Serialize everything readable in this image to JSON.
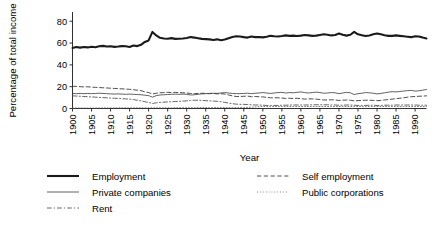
{
  "chart_data": {
    "type": "line",
    "title": "",
    "xlabel": "Year",
    "ylabel": "Percentage of total income",
    "xlim": [
      1900,
      1993
    ],
    "ylim": [
      0,
      88
    ],
    "yticks": [
      0,
      20,
      40,
      60,
      80
    ],
    "ytick_labels": [
      "0",
      "20",
      "40",
      "60",
      "80"
    ],
    "xticks": [
      1900,
      1905,
      1910,
      1915,
      1920,
      1925,
      1930,
      1935,
      1940,
      1945,
      1950,
      1955,
      1960,
      1965,
      1970,
      1975,
      1980,
      1985,
      1990
    ],
    "xtick_labels": [
      "1900",
      "1905",
      "1910",
      "1915",
      "1920",
      "1925",
      "1930",
      "1935",
      "1940",
      "1945",
      "1950",
      "1955",
      "1960",
      "1965",
      "1970",
      "1975",
      "1980",
      "1985",
      "1990"
    ],
    "grid": false,
    "legend_position": "bottom",
    "x": [
      1900,
      1901,
      1902,
      1903,
      1904,
      1905,
      1906,
      1907,
      1908,
      1909,
      1910,
      1911,
      1912,
      1913,
      1914,
      1915,
      1916,
      1917,
      1918,
      1919,
      1920,
      1921,
      1922,
      1923,
      1924,
      1925,
      1926,
      1927,
      1928,
      1929,
      1930,
      1931,
      1932,
      1933,
      1934,
      1935,
      1936,
      1937,
      1938,
      1939,
      1940,
      1941,
      1942,
      1943,
      1944,
      1945,
      1946,
      1947,
      1948,
      1949,
      1950,
      1951,
      1952,
      1953,
      1954,
      1955,
      1956,
      1957,
      1958,
      1959,
      1960,
      1961,
      1962,
      1963,
      1964,
      1965,
      1966,
      1967,
      1968,
      1969,
      1970,
      1971,
      1972,
      1973,
      1974,
      1975,
      1976,
      1977,
      1978,
      1979,
      1980,
      1981,
      1982,
      1983,
      1984,
      1985,
      1986,
      1987,
      1988,
      1989,
      1990,
      1991,
      1992,
      1993
    ],
    "series": [
      {
        "name": "Employment",
        "style": "solid",
        "width": 2.1,
        "color": "#1a1a1a",
        "values": [
          55.5,
          56.3,
          55.8,
          56.4,
          56.0,
          56.6,
          56.2,
          57.0,
          57.4,
          56.8,
          57.0,
          56.5,
          56.8,
          57.2,
          57.0,
          56.4,
          57.8,
          57.2,
          58.4,
          61.0,
          62.4,
          70.2,
          67.0,
          64.8,
          64.2,
          64.0,
          64.5,
          63.8,
          64.0,
          64.2,
          64.6,
          65.5,
          65.0,
          64.4,
          63.8,
          63.6,
          63.4,
          62.8,
          63.4,
          62.6,
          63.2,
          64.4,
          65.6,
          66.2,
          66.0,
          65.4,
          65.0,
          66.0,
          65.4,
          65.6,
          65.2,
          65.8,
          66.6,
          66.2,
          66.0,
          66.4,
          67.0,
          66.6,
          66.8,
          66.4,
          66.8,
          67.4,
          67.0,
          66.6,
          66.8,
          67.4,
          68.0,
          67.6,
          67.0,
          67.4,
          68.8,
          67.6,
          66.8,
          67.6,
          70.2,
          68.0,
          67.2,
          66.4,
          67.0,
          68.0,
          68.8,
          68.0,
          67.2,
          66.6,
          66.6,
          67.0,
          66.6,
          66.2,
          65.8,
          65.4,
          66.2,
          66.0,
          65.0,
          64.2
        ]
      },
      {
        "name": "Self employment",
        "style": "dashed",
        "width": 0.9,
        "color": "#3a3a3a",
        "values": [
          20.4,
          20.2,
          20.0,
          19.8,
          19.9,
          19.6,
          19.4,
          19.2,
          19.0,
          18.8,
          18.6,
          18.4,
          18.2,
          18.0,
          17.8,
          17.6,
          17.2,
          16.8,
          16.4,
          15.2,
          14.6,
          13.2,
          14.0,
          14.4,
          14.6,
          14.8,
          14.6,
          14.8,
          14.6,
          14.4,
          14.2,
          13.8,
          13.6,
          13.8,
          14.0,
          13.8,
          13.6,
          13.8,
          13.4,
          13.6,
          13.2,
          12.4,
          11.6,
          11.0,
          11.0,
          11.2,
          11.4,
          10.8,
          11.0,
          10.8,
          10.6,
          10.2,
          9.8,
          9.8,
          9.8,
          9.6,
          9.2,
          9.4,
          9.2,
          9.4,
          9.0,
          8.6,
          8.8,
          8.8,
          8.6,
          8.2,
          7.8,
          7.8,
          8.0,
          7.8,
          7.4,
          7.6,
          7.8,
          7.6,
          7.0,
          7.2,
          7.4,
          7.6,
          7.6,
          7.4,
          7.2,
          7.4,
          7.8,
          8.2,
          8.6,
          9.0,
          9.4,
          9.8,
          10.4,
          10.8,
          11.0,
          11.2,
          11.4,
          11.6
        ]
      },
      {
        "name": "Private companies",
        "style": "solid",
        "width": 0.8,
        "color": "#3a3a3a",
        "values": [
          13.8,
          13.6,
          13.8,
          13.6,
          13.8,
          13.6,
          13.8,
          14.0,
          13.8,
          13.6,
          13.4,
          13.2,
          13.4,
          13.2,
          13.0,
          13.2,
          13.0,
          12.8,
          12.6,
          12.2,
          11.8,
          10.4,
          11.8,
          12.4,
          12.6,
          12.8,
          13.0,
          13.2,
          13.0,
          13.2,
          13.0,
          12.4,
          12.6,
          13.0,
          13.4,
          13.6,
          13.8,
          14.0,
          13.8,
          14.2,
          14.6,
          14.2,
          13.8,
          13.6,
          13.6,
          13.8,
          14.0,
          13.6,
          14.0,
          14.2,
          14.6,
          14.2,
          13.8,
          14.2,
          14.6,
          14.8,
          14.2,
          14.6,
          14.4,
          14.8,
          15.2,
          14.6,
          14.2,
          14.6,
          15.0,
          14.6,
          14.0,
          14.2,
          14.6,
          14.4,
          13.6,
          14.2,
          14.8,
          14.4,
          12.8,
          13.6,
          14.0,
          14.6,
          14.4,
          14.0,
          13.4,
          13.8,
          14.4,
          15.0,
          15.4,
          15.2,
          15.6,
          16.0,
          16.4,
          16.6,
          16.0,
          16.2,
          16.8,
          17.4
        ]
      },
      {
        "name": "Rent",
        "style": "dashdot",
        "width": 0.85,
        "color": "#4a4a4a",
        "values": [
          11.6,
          11.4,
          11.2,
          11.0,
          10.8,
          10.6,
          10.4,
          10.2,
          10.0,
          9.8,
          9.6,
          9.4,
          9.2,
          9.0,
          8.8,
          8.6,
          8.2,
          7.6,
          7.0,
          6.2,
          5.6,
          4.6,
          5.2,
          5.6,
          5.8,
          6.0,
          6.2,
          6.4,
          6.6,
          6.8,
          7.0,
          7.4,
          7.6,
          7.6,
          7.4,
          7.2,
          7.0,
          6.8,
          6.6,
          6.2,
          5.6,
          5.0,
          4.4,
          4.0,
          3.8,
          3.8,
          3.6,
          3.4,
          3.2,
          3.2,
          3.0,
          2.8,
          2.8,
          2.8,
          2.8,
          3.0,
          3.0,
          3.2,
          3.2,
          3.2,
          3.2,
          3.2,
          3.2,
          3.4,
          3.4,
          3.4,
          3.4,
          3.4,
          3.2,
          3.2,
          3.0,
          3.0,
          3.2,
          3.2,
          3.0,
          2.8,
          2.8,
          2.8,
          3.0,
          3.0,
          2.8,
          2.8,
          3.0,
          3.0,
          3.0,
          3.2,
          3.2,
          3.2,
          3.2,
          3.2,
          3.2,
          3.0,
          3.0,
          3.0
        ]
      },
      {
        "name": "Public corporations",
        "style": "dotted",
        "width": 0.8,
        "color": "#555555",
        "values": [
          0.4,
          0.4,
          0.4,
          0.4,
          0.4,
          0.4,
          0.4,
          0.5,
          0.5,
          0.5,
          0.5,
          0.5,
          0.5,
          0.6,
          0.6,
          0.6,
          0.6,
          0.6,
          0.6,
          0.6,
          0.6,
          0.6,
          0.6,
          0.6,
          0.6,
          0.6,
          0.6,
          0.7,
          0.7,
          0.7,
          0.7,
          0.7,
          0.7,
          0.8,
          0.8,
          0.8,
          0.8,
          0.8,
          0.8,
          0.8,
          0.8,
          0.8,
          0.8,
          0.8,
          0.8,
          0.8,
          1.0,
          1.2,
          1.4,
          1.6,
          1.8,
          1.8,
          1.8,
          1.8,
          1.8,
          1.8,
          1.8,
          1.8,
          1.8,
          1.8,
          1.8,
          1.8,
          1.8,
          1.8,
          1.8,
          1.8,
          1.8,
          1.8,
          1.8,
          1.8,
          1.8,
          1.8,
          1.8,
          1.8,
          1.8,
          1.8,
          1.8,
          1.8,
          1.8,
          1.8,
          1.8,
          1.8,
          1.8,
          1.8,
          1.8,
          1.8,
          1.8,
          1.8,
          1.8,
          1.8,
          1.8,
          1.8,
          1.8,
          1.8
        ]
      }
    ]
  },
  "legend": {
    "items": [
      {
        "label": "Employment",
        "style": "solid-thick"
      },
      {
        "label": "Self employment",
        "style": "dashed"
      },
      {
        "label": "Private companies",
        "style": "solid-thin"
      },
      {
        "label": "Public corporations",
        "style": "dotted"
      },
      {
        "label": "Rent",
        "style": "dashdot"
      }
    ]
  },
  "colors": {
    "axis": "#1a1a1a",
    "text": "#000000",
    "background": "#ffffff"
  }
}
